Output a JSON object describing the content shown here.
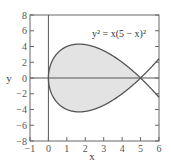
{
  "chart_data": {
    "type": "line",
    "title": "",
    "equation_label": "y² = x(5 − x)²",
    "xlabel": "x",
    "ylabel": "y",
    "xlim": [
      -1,
      6
    ],
    "ylim": [
      -8,
      8
    ],
    "xticks": [
      -1,
      0,
      1,
      2,
      3,
      4,
      5,
      6
    ],
    "yticks": [
      -8,
      -6,
      -4,
      -2,
      0,
      2,
      4,
      6,
      8
    ],
    "grid": false,
    "legend": "none",
    "series": [
      {
        "name": "y = +sqrt(x)(5 - x)",
        "x": [
          0,
          0.05,
          0.2,
          0.5,
          1,
          1.667,
          2,
          3,
          4,
          5,
          6
        ],
        "y": [
          0,
          1.1,
          2.15,
          3.18,
          4.0,
          4.3,
          4.24,
          3.46,
          2.0,
          0,
          -2.45
        ]
      },
      {
        "name": "y = -sqrt(x)(5 - x)",
        "x": [
          0,
          0.05,
          0.2,
          0.5,
          1,
          1.667,
          2,
          3,
          4,
          5,
          6
        ],
        "y": [
          0,
          -1.1,
          -2.15,
          -3.18,
          -4.0,
          -4.3,
          -4.24,
          -3.46,
          -2.0,
          0,
          2.45
        ]
      }
    ],
    "shaded_region": {
      "description": "enclosed loop between x=0 and x=5",
      "x_range": [
        0,
        5
      ],
      "fill": "#e3e3e3"
    },
    "colors": {
      "curve": "#555555",
      "fill": "#e3e3e3",
      "frame": "#666666",
      "axes": "#555555"
    }
  },
  "labels": {
    "x_ticks": [
      "−1",
      "0",
      "1",
      "2",
      "3",
      "4",
      "5",
      "6"
    ],
    "y_ticks": [
      "−8",
      "−6",
      "−4",
      "−2",
      "0",
      "2",
      "4",
      "6",
      "8"
    ],
    "xlabel": "x",
    "ylabel": "y",
    "equation": "y² = x(5 − x)²"
  }
}
